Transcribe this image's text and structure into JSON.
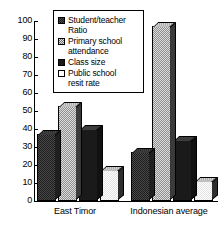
{
  "chart_data": {
    "type": "bar",
    "title": "",
    "subtitle": "",
    "xlabel": "",
    "ylabel": "",
    "ylim": [
      0,
      100
    ],
    "ytick_labels": [
      "0",
      "10",
      "20",
      "30",
      "40",
      "50",
      "60",
      "70",
      "80",
      "90",
      "100"
    ],
    "ytick_values": [
      0,
      10,
      20,
      30,
      40,
      50,
      60,
      70,
      80,
      90,
      100
    ],
    "grid": false,
    "legend_position": "top-center",
    "categories": [
      "East Timor",
      "Indonesian average"
    ],
    "series": [
      {
        "name": "Student/teacher Ratio",
        "legend_label": "Student/teacher\nRatio",
        "swatch": "sw-dark",
        "fill": "fill-dark",
        "values": [
          37,
          27
        ]
      },
      {
        "name": "Primary school attendance",
        "legend_label": "Primary school\nattendance",
        "swatch": "sw-mid",
        "fill": "fill-mid",
        "values": [
          53,
          97
        ]
      },
      {
        "name": "Class size",
        "legend_label": "Class size",
        "swatch": "sw-black",
        "fill": "fill-black",
        "values": [
          40,
          34
        ]
      },
      {
        "name": "Public school resit rate",
        "legend_label": "Public school\nresit  rate",
        "swatch": "sw-white",
        "fill": "fill-white",
        "values": [
          17,
          11
        ]
      }
    ]
  }
}
